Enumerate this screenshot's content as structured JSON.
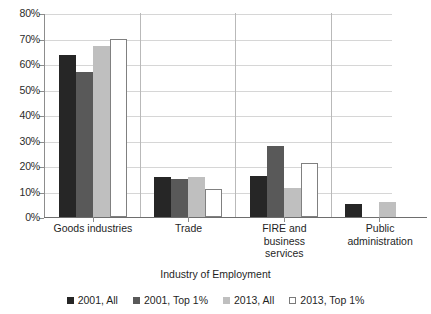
{
  "chart_data": {
    "type": "bar",
    "title": "",
    "xlabel": "Industry of Employment",
    "ylabel": "",
    "ylim": [
      0,
      80
    ],
    "ytick_step": 10,
    "ytick_labels": [
      "0%",
      "10%",
      "20%",
      "30%",
      "40%",
      "50%",
      "60%",
      "70%",
      "80%"
    ],
    "grid": true,
    "legend_position": "bottom",
    "categories": [
      "Goods industries",
      "Trade",
      "FIRE and business services",
      "Public administration"
    ],
    "category_labels": [
      [
        "Goods industries"
      ],
      [
        "Trade"
      ],
      [
        "FIRE and",
        "business",
        "services"
      ],
      [
        "Public",
        "administration"
      ]
    ],
    "series": [
      {
        "name": "2001, All",
        "color": "#262626",
        "values": [
          63.5,
          15.5,
          16.0,
          5.0
        ]
      },
      {
        "name": "2001, Top 1%",
        "color": "#595959",
        "values": [
          57.0,
          15.0,
          28.0,
          0.0
        ]
      },
      {
        "name": "2013, All",
        "color": "#bfbfbf",
        "values": [
          67.0,
          15.5,
          11.5,
          6.0
        ]
      },
      {
        "name": "2013, Top 1%",
        "color": "#ffffff",
        "values": [
          70.0,
          11.0,
          21.0,
          0.0
        ]
      }
    ]
  },
  "colors": {
    "series_1": "#262626",
    "series_2": "#595959",
    "series_3": "#bfbfbf",
    "series_4": "#ffffff",
    "gridline": "#d6d6d6",
    "axis": "#6e6e6e",
    "text": "#1f1f1f"
  }
}
